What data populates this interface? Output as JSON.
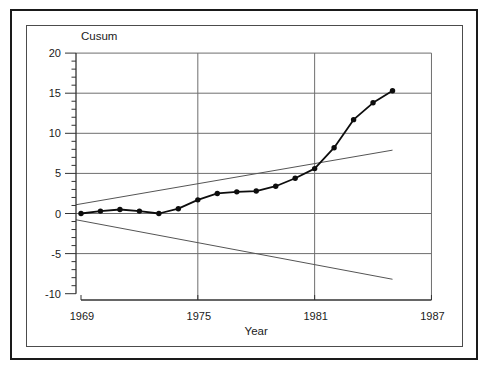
{
  "figure": {
    "background": "#ffffff",
    "outer_border_color": "#1a1a1a",
    "inner_border_color": "#4c4c4c"
  },
  "chart_data": {
    "type": "line",
    "title": "Cusum",
    "ylabel": "Cusum",
    "xlabel": "Year",
    "x": [
      1969,
      1970,
      1971,
      1972,
      1973,
      1974,
      1975,
      1976,
      1977,
      1978,
      1979,
      1980,
      1981,
      1982,
      1983,
      1984,
      1985
    ],
    "series": [
      {
        "name": "cusum",
        "values": [
          0.0,
          0.3,
          0.5,
          0.3,
          0.0,
          0.6,
          1.7,
          2.5,
          2.7,
          2.8,
          3.4,
          4.4,
          5.6,
          8.2,
          11.7,
          13.8,
          15.3
        ]
      }
    ],
    "decision_lines": [
      {
        "name": "upper-boundary",
        "start": {
          "year": 1969,
          "value": 1.2
        },
        "end": {
          "year": 1985,
          "value": 7.9
        }
      },
      {
        "name": "lower-boundary",
        "start": {
          "year": 1969,
          "value": -0.9
        },
        "end": {
          "year": 1985,
          "value": -8.2
        }
      }
    ],
    "xlim": [
      1969,
      1987
    ],
    "ylim": [
      -10,
      20
    ],
    "x_ticks": [
      1969,
      1975,
      1981,
      1987
    ],
    "y_ticks": [
      -10,
      -5,
      0,
      5,
      10,
      15,
      20
    ],
    "y_minor_tick_step": 1,
    "h_gridlines_at": [
      -5,
      0,
      5,
      10,
      15,
      20
    ],
    "v_gridlines_at": [
      1975,
      1981,
      1987
    ],
    "legend": "none",
    "grid": "on",
    "colors": {
      "series": "#0d0d0d",
      "grid": "#6e6e6e",
      "decision": "#555555",
      "axis": "#333333",
      "text": "#1a1a1a"
    }
  }
}
